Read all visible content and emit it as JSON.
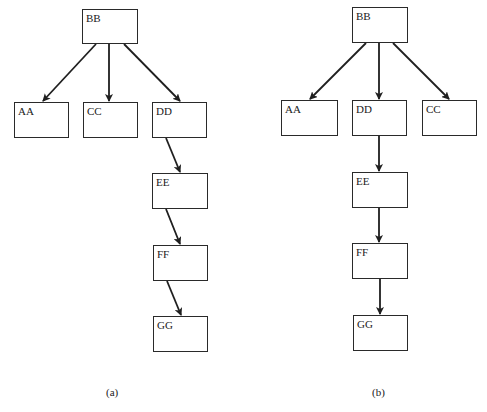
{
  "diagrams": [
    {
      "id": "a",
      "caption": "(a)",
      "nodes": [
        {
          "label": "BB",
          "x": 82,
          "y": 9,
          "w": 56,
          "h": 35
        },
        {
          "label": "AA",
          "x": 14,
          "y": 102,
          "w": 55,
          "h": 36
        },
        {
          "label": "CC",
          "x": 83,
          "y": 102,
          "w": 55,
          "h": 36
        },
        {
          "label": "DD",
          "x": 152,
          "y": 102,
          "w": 55,
          "h": 36
        },
        {
          "label": "EE",
          "x": 152,
          "y": 173,
          "w": 56,
          "h": 36
        },
        {
          "label": "FF",
          "x": 153,
          "y": 245,
          "w": 55,
          "h": 36
        },
        {
          "label": "GG",
          "x": 153,
          "y": 316,
          "w": 55,
          "h": 36
        }
      ],
      "edges": [
        {
          "from": "BB",
          "to": "AA",
          "x1": 96,
          "y1": 44,
          "x2": 43,
          "y2": 101
        },
        {
          "from": "BB",
          "to": "CC",
          "x1": 109,
          "y1": 44,
          "x2": 109,
          "y2": 101
        },
        {
          "from": "BB",
          "to": "DD",
          "x1": 124,
          "y1": 44,
          "x2": 180,
          "y2": 101
        },
        {
          "from": "DD",
          "to": "EE",
          "x1": 166,
          "y1": 138,
          "x2": 180,
          "y2": 172
        },
        {
          "from": "EE",
          "to": "FF",
          "x1": 166,
          "y1": 209,
          "x2": 180,
          "y2": 244
        },
        {
          "from": "FF",
          "to": "GG",
          "x1": 167,
          "y1": 281,
          "x2": 181,
          "y2": 315
        }
      ],
      "caption_pos": {
        "x": 106,
        "y": 386
      }
    },
    {
      "id": "b",
      "caption": "(b)",
      "nodes": [
        {
          "label": "BB",
          "x": 352,
          "y": 7,
          "w": 56,
          "h": 36
        },
        {
          "label": "AA",
          "x": 281,
          "y": 100,
          "w": 57,
          "h": 36
        },
        {
          "label": "DD",
          "x": 352,
          "y": 100,
          "w": 55,
          "h": 36
        },
        {
          "label": "CC",
          "x": 422,
          "y": 100,
          "w": 55,
          "h": 36
        },
        {
          "label": "EE",
          "x": 352,
          "y": 172,
          "w": 56,
          "h": 36
        },
        {
          "label": "FF",
          "x": 352,
          "y": 243,
          "w": 56,
          "h": 36
        },
        {
          "label": "GG",
          "x": 353,
          "y": 315,
          "w": 55,
          "h": 36
        }
      ],
      "edges": [
        {
          "from": "BB",
          "to": "AA",
          "x1": 366,
          "y1": 43,
          "x2": 310,
          "y2": 99
        },
        {
          "from": "BB",
          "to": "DD",
          "x1": 379,
          "y1": 43,
          "x2": 379,
          "y2": 99
        },
        {
          "from": "BB",
          "to": "CC",
          "x1": 393,
          "y1": 43,
          "x2": 449,
          "y2": 99
        },
        {
          "from": "DD",
          "to": "EE",
          "x1": 379,
          "y1": 136,
          "x2": 379,
          "y2": 171
        },
        {
          "from": "EE",
          "to": "FF",
          "x1": 379,
          "y1": 208,
          "x2": 379,
          "y2": 242
        },
        {
          "from": "FF",
          "to": "GG",
          "x1": 380,
          "y1": 279,
          "x2": 380,
          "y2": 314
        }
      ],
      "caption_pos": {
        "x": 372,
        "y": 386
      }
    }
  ],
  "colors": {
    "line": "#1f1f1f",
    "box_border": "#2a2a2a",
    "background": "#ffffff"
  }
}
